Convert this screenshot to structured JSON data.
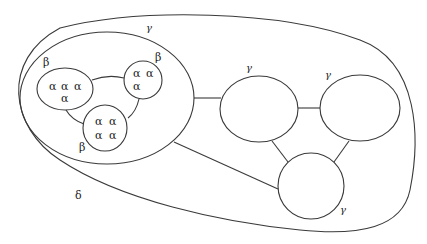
{
  "diagram": {
    "outer_label": "δ",
    "inner_group_label": "γ",
    "beta_labels": [
      "β",
      "β",
      "β"
    ],
    "gamma_node_labels": [
      "γ",
      "γ",
      "γ"
    ],
    "beta_clusters": [
      {
        "alphas": [
          "α",
          "α",
          "α",
          "α"
        ]
      },
      {
        "alphas": [
          "α",
          "α",
          "α"
        ]
      },
      {
        "alphas": [
          "α",
          "α",
          "α",
          "α"
        ]
      }
    ]
  }
}
